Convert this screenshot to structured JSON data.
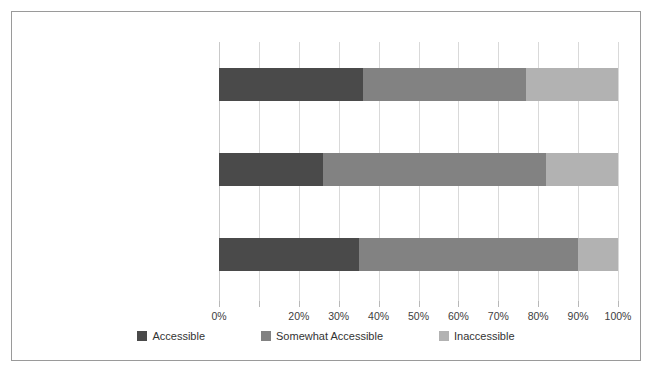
{
  "chart_data": {
    "type": "bar",
    "orientation": "horizontal",
    "stacked": true,
    "title": "",
    "xlabel": "",
    "ylabel": "",
    "categories": [
      "Mobility Accessibility",
      "Sensory Accessibility",
      "Cognitive Accessibility"
    ],
    "series": [
      {
        "name": "Accessible",
        "color": "#4a4a4a",
        "values": [
          36,
          26,
          35
        ]
      },
      {
        "name": "Somewhat Accessible",
        "color": "#828282",
        "values": [
          41,
          56,
          55
        ]
      },
      {
        "name": "Inaccessible",
        "color": "#b2b2b2",
        "values": [
          23,
          18,
          10
        ]
      }
    ],
    "xlim": [
      0,
      100
    ],
    "x_ticks": [
      0,
      10,
      20,
      30,
      40,
      50,
      60,
      70,
      80,
      90,
      100
    ],
    "x_tick_labels": [
      "0%",
      "",
      "20%",
      "30%",
      "40%",
      "50%",
      "60%",
      "70%",
      "80%",
      "90%",
      "100%"
    ],
    "grid": true,
    "grid_axis": "x",
    "legend_position": "bottom",
    "value_suffix": "%"
  },
  "frame": {
    "border_color": "#9a9a9a",
    "background": "#ffffff"
  },
  "axis": {
    "gridline_color": "#d9d9d9",
    "tick_color": "#b8b8b8",
    "label_color": "#404040"
  }
}
